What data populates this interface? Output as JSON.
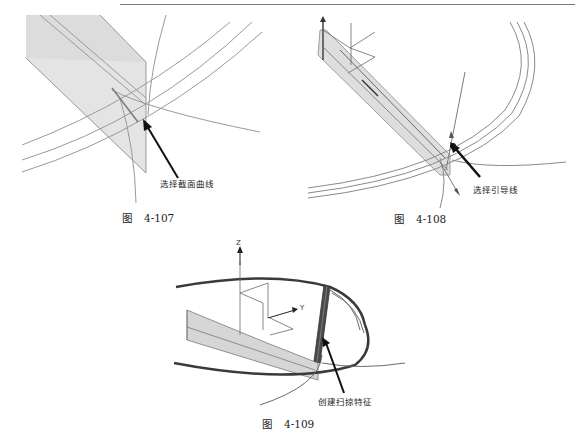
{
  "page": {
    "header_rule": true
  },
  "figures": [
    {
      "id": "fig-4-107",
      "caption_prefix": "图",
      "caption_number": "4-107",
      "callout": "选择截面曲线",
      "description": "Sweep section: selecting the section curve on a shaded plane intersecting three guide arcs"
    },
    {
      "id": "fig-4-108",
      "caption_prefix": "图",
      "caption_number": "4-108",
      "callout": "选择引导线",
      "description": "Selecting the guide line (arc path) for the sweep"
    },
    {
      "id": "fig-4-109",
      "caption_prefix": "图",
      "caption_number": "4-109",
      "callout": "创建扫掠特征",
      "axis_labels": {
        "z": "Z",
        "y": "Y"
      },
      "description": "Resulting swept feature along the elliptical guide"
    }
  ],
  "colors": {
    "plane_fill": "#d9d9d9",
    "line": "#8a8a8a",
    "arrow": "#111111",
    "sweep_body": "#4a4a4a"
  }
}
